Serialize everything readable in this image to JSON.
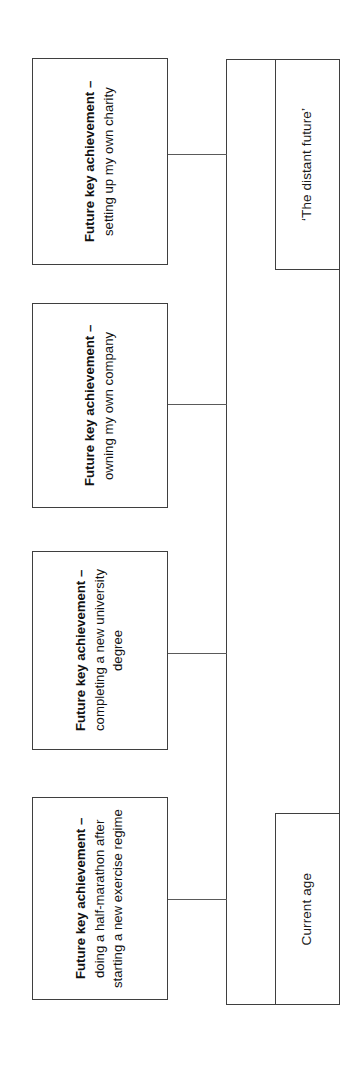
{
  "diagram": {
    "orientation": "rotated-90-ccw",
    "colors": {
      "background": "#ffffff",
      "stroke": "#3f3f3f",
      "connector": "#5a5a5a",
      "text": "#111111"
    },
    "timeline": {
      "start_label": "Current age",
      "end_label": "‘The distant future’"
    },
    "events": [
      {
        "id": "event-1",
        "heading": "Future key achievement – ",
        "detail": "setting up my own charity"
      },
      {
        "id": "event-2",
        "heading": "Future key achievement – ",
        "detail": "owning my own company"
      },
      {
        "id": "event-3",
        "heading": "Future key achievement – ",
        "detail": "completing a new university degree"
      },
      {
        "id": "event-4",
        "heading": "Future key achievement – ",
        "detail": "doing a half-marathon after starting a new exercise regime"
      }
    ]
  }
}
